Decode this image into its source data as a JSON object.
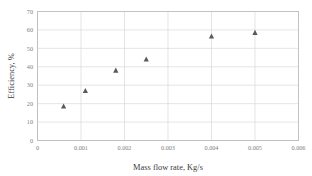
{
  "chart_data": {
    "type": "scatter",
    "title": "",
    "xlabel": "Mass flow rate, Kg/s",
    "ylabel": "Efficiency, %",
    "xlim": [
      0,
      0.006
    ],
    "ylim": [
      0,
      70
    ],
    "xticks": [
      0,
      0.001,
      0.002,
      0.003,
      0.004,
      0.005,
      0.006
    ],
    "xtick_labels": [
      "0",
      "0.001",
      "0.002",
      "0.003",
      "0.004",
      "0.005",
      "0.006"
    ],
    "yticks": [
      0,
      10,
      20,
      30,
      40,
      50,
      60,
      70
    ],
    "ytick_labels": [
      "0",
      "10",
      "20",
      "30",
      "40",
      "50",
      "60",
      "70"
    ],
    "grid": true,
    "grid_axes": "both",
    "legend": false,
    "legend_position": "none",
    "marker_shape": "triangle",
    "marker_color": "#595959",
    "grid_color": "#d9d9d9",
    "axis_color": "#bfbfbf",
    "tick_label_color": "#808080",
    "axis_title_color": "#3a3a3a",
    "series": [
      {
        "name": "Efficiency",
        "x": [
          0.0006,
          0.0011,
          0.0018,
          0.0025,
          0.004,
          0.005
        ],
        "y": [
          18.5,
          27.0,
          38.0,
          44.0,
          56.5,
          58.5
        ]
      }
    ]
  }
}
